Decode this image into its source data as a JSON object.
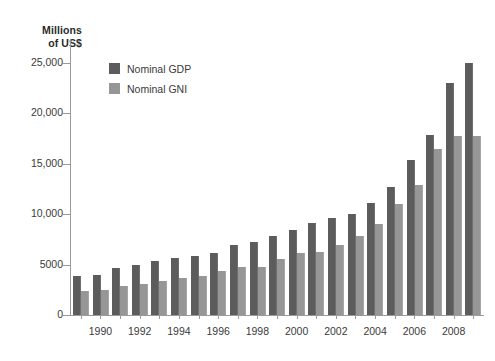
{
  "chart_data": {
    "type": "bar",
    "title": "Millions of US$",
    "title_lines": [
      "Millions",
      "of US$"
    ],
    "xlabel": "",
    "ylabel": "Millions of US$",
    "ylim": [
      0,
      25000
    ],
    "grid": false,
    "legend_position": "top-left-inside",
    "ytick_labels": [
      "0",
      "5000",
      "10,000",
      "15,000",
      "20,000",
      "25,000"
    ],
    "ytick_values": [
      0,
      5000,
      10000,
      15000,
      20000,
      25000
    ],
    "categories": [
      1989,
      1990,
      1991,
      1992,
      1993,
      1994,
      1995,
      1996,
      1997,
      1998,
      1999,
      2000,
      2001,
      2002,
      2003,
      2004,
      2005,
      2006,
      2007,
      2008,
      2009
    ],
    "xtick_labels": [
      "1990",
      "1992",
      "1994",
      "1996",
      "1998",
      "2000",
      "2002",
      "2004",
      "2006",
      "2008"
    ],
    "xtick_values": [
      1990,
      1992,
      1994,
      1996,
      1998,
      2000,
      2002,
      2004,
      2006,
      2008
    ],
    "series": [
      {
        "name": "Nominal GDP",
        "color": "#5c5c5c",
        "values": [
          3900,
          4000,
          4700,
          5000,
          5400,
          5700,
          5900,
          6200,
          6900,
          7200,
          7800,
          8400,
          9100,
          9600,
          10000,
          11100,
          12700,
          15400,
          17900,
          23000,
          25000
        ]
      },
      {
        "name": "Nominal GNI",
        "color": "#969696",
        "values": [
          2400,
          2500,
          2900,
          3100,
          3400,
          3700,
          3900,
          4400,
          4800,
          4800,
          5600,
          6200,
          6300,
          6900,
          7800,
          9000,
          11000,
          12900,
          16500,
          17800,
          17800
        ]
      }
    ]
  },
  "legend": {
    "items": [
      {
        "label": "Nominal GDP",
        "color": "#5c5c5c"
      },
      {
        "label": "Nominal GNI",
        "color": "#969696"
      }
    ]
  }
}
